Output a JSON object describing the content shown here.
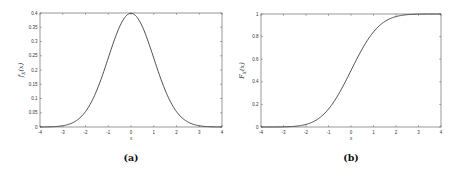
{
  "chart_data": [
    {
      "type": "line",
      "title": "",
      "caption": "(a)",
      "xlabel": "x",
      "ylabel": "f_X(x)",
      "xlim": [
        -4,
        4
      ],
      "ylim": [
        0,
        0.4
      ],
      "xticks": [
        "-4",
        "-3",
        "-2",
        "-1",
        "0",
        "1",
        "2",
        "3",
        "4"
      ],
      "yticks": [
        "0",
        "0.05",
        "0.1",
        "0.15",
        "0.2",
        "0.25",
        "0.3",
        "0.35",
        "0.4"
      ],
      "grid": false,
      "series": [
        {
          "name": "standard normal PDF",
          "x": [
            -4,
            -3.5,
            -3,
            -2.5,
            -2,
            -1.5,
            -1,
            -0.5,
            0,
            0.5,
            1,
            1.5,
            2,
            2.5,
            3,
            3.5,
            4
          ],
          "values": [
            0.0001,
            0.0009,
            0.0044,
            0.0175,
            0.054,
            0.1295,
            0.242,
            0.3521,
            0.3989,
            0.3521,
            0.242,
            0.1295,
            0.054,
            0.0175,
            0.0044,
            0.0009,
            0.0001
          ]
        }
      ]
    },
    {
      "type": "line",
      "title": "",
      "caption": "(b)",
      "xlabel": "x",
      "ylabel": "F_X(x)",
      "xlim": [
        -4,
        4
      ],
      "ylim": [
        0,
        1
      ],
      "xticks": [
        "-4",
        "-3",
        "-2",
        "-1",
        "0",
        "1",
        "2",
        "3",
        "4"
      ],
      "yticks": [
        "0",
        "0.2",
        "0.4",
        "0.6",
        "0.8",
        "1"
      ],
      "grid": false,
      "series": [
        {
          "name": "standard normal CDF",
          "x": [
            -4,
            -3.5,
            -3,
            -2.5,
            -2,
            -1.5,
            -1,
            -0.5,
            0,
            0.5,
            1,
            1.5,
            2,
            2.5,
            3,
            3.5,
            4
          ],
          "values": [
            0.0,
            0.0002,
            0.0013,
            0.0062,
            0.0228,
            0.0668,
            0.1587,
            0.3085,
            0.5,
            0.6915,
            0.8413,
            0.9332,
            0.9772,
            0.9938,
            0.9987,
            0.9998,
            1.0
          ]
        }
      ]
    }
  ],
  "figure": {
    "left": {
      "caption": "(a)",
      "xlabel": "x",
      "ylabel_main": "f",
      "ylabel_sub": "X",
      "ylabel_arg": "(x)"
    },
    "right": {
      "caption": "(b)",
      "xlabel": "x",
      "ylabel_main": "F",
      "ylabel_sub": "X",
      "ylabel_arg": "(x)"
    }
  },
  "style": {
    "line_color": "#3a3a3a",
    "axis_color": "#555555"
  }
}
